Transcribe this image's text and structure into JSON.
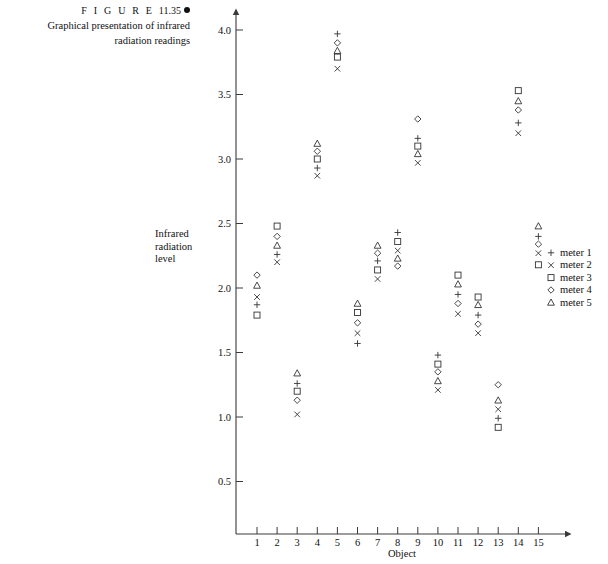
{
  "caption": {
    "figure_word": "F I G U R E",
    "figure_number": "11.35",
    "line1": "Graphical presentation of infrared",
    "line2": "radiation readings"
  },
  "axis": {
    "ylabel_line1": "Infrared",
    "ylabel_line2": "radiation",
    "ylabel_line3": "level",
    "xlabel": "Object"
  },
  "legend": {
    "items": [
      {
        "symbol": "plus",
        "label": "meter 1"
      },
      {
        "symbol": "cross",
        "label": "meter 2"
      },
      {
        "symbol": "square",
        "label": "meter 3"
      },
      {
        "symbol": "diamond",
        "label": "meter 4"
      },
      {
        "symbol": "triangle",
        "label": "meter 5"
      }
    ]
  },
  "chart_data": {
    "type": "scatter",
    "title": "Graphical presentation of infrared radiation readings",
    "xlabel": "Object",
    "ylabel": "Infrared radiation level",
    "xlim": [
      0,
      16
    ],
    "ylim": [
      0,
      4.25
    ],
    "xticks": [
      1,
      2,
      3,
      4,
      5,
      6,
      7,
      8,
      9,
      10,
      11,
      12,
      13,
      14,
      15
    ],
    "xtick_labels": [
      "1",
      "2",
      "3",
      "4",
      "5",
      "6",
      "7",
      "8",
      "9",
      "10",
      "11",
      "12",
      "13",
      "14",
      "15"
    ],
    "yticks": [
      0.5,
      1.0,
      1.5,
      2.0,
      2.5,
      3.0,
      3.5,
      4.0
    ],
    "ytick_labels": [
      "0.5",
      "1.0",
      "1.5",
      "2.0",
      "2.5",
      "3.0",
      "3.5",
      "4.0"
    ],
    "grid": false,
    "legend_position": "right",
    "x": [
      1,
      2,
      3,
      4,
      5,
      6,
      7,
      8,
      9,
      10,
      11,
      12,
      13,
      14,
      15
    ],
    "series": [
      {
        "name": "meter 1",
        "symbol": "plus",
        "values": [
          1.87,
          2.26,
          1.26,
          2.93,
          3.97,
          1.57,
          2.21,
          2.43,
          3.16,
          1.48,
          1.95,
          1.79,
          0.99,
          3.28,
          2.4
        ]
      },
      {
        "name": "meter 2",
        "symbol": "cross",
        "values": [
          1.93,
          2.2,
          1.02,
          2.87,
          3.7,
          1.65,
          2.07,
          2.29,
          2.97,
          1.21,
          1.8,
          1.65,
          1.06,
          3.2,
          2.27
        ]
      },
      {
        "name": "meter 3",
        "symbol": "square",
        "values": [
          1.79,
          2.48,
          1.2,
          3.0,
          3.79,
          1.81,
          2.14,
          2.36,
          3.1,
          1.41,
          2.1,
          1.93,
          0.92,
          3.53,
          2.18
        ]
      },
      {
        "name": "meter 4",
        "symbol": "diamond",
        "values": [
          2.1,
          2.4,
          1.13,
          3.06,
          3.9,
          1.73,
          2.27,
          2.17,
          3.31,
          1.35,
          1.88,
          1.72,
          1.25,
          3.38,
          2.34
        ]
      },
      {
        "name": "meter 5",
        "symbol": "triangle",
        "values": [
          2.02,
          2.33,
          1.34,
          3.12,
          3.84,
          1.88,
          2.33,
          2.23,
          3.04,
          1.28,
          2.03,
          1.87,
          1.13,
          3.45,
          2.48
        ]
      }
    ]
  }
}
